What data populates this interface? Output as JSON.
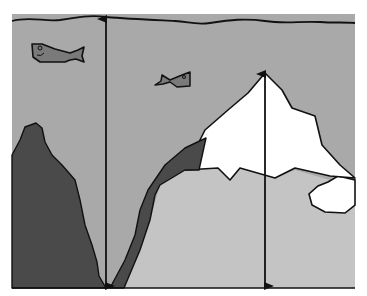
{
  "diagram": {
    "title": "",
    "colors": {
      "background": "#ffffff",
      "water": "#a9a9a9",
      "rock": "#4a4a4a",
      "seafloor_light": "#c4c4c4",
      "ice": "#ffffff",
      "fish": "#7a7a7a",
      "stroke": "#111111"
    },
    "elements": [
      {
        "name": "water-surface",
        "type": "wavy-line"
      },
      {
        "name": "fish-large",
        "type": "fish"
      },
      {
        "name": "fish-small",
        "type": "fish"
      },
      {
        "name": "dark-rock-left",
        "type": "landmass"
      },
      {
        "name": "dark-ridge",
        "type": "landmass"
      },
      {
        "name": "iceberg",
        "type": "ice"
      },
      {
        "name": "small-ice-floe",
        "type": "ice"
      },
      {
        "name": "depth-arrow-trench",
        "type": "double-arrow"
      },
      {
        "name": "depth-arrow-iceberg",
        "type": "double-arrow"
      }
    ]
  }
}
